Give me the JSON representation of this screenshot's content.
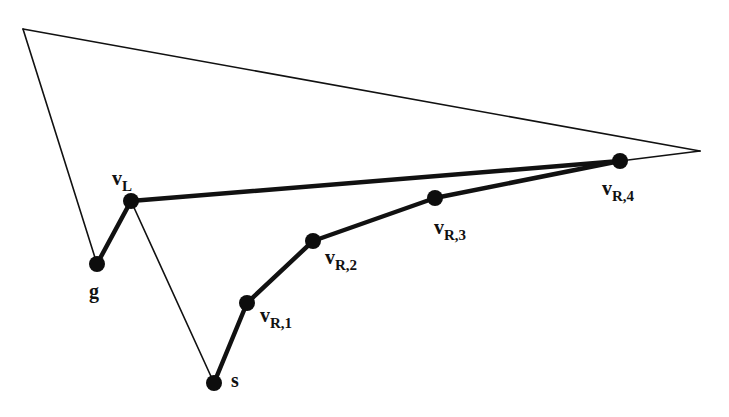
{
  "diagram": {
    "colors": {
      "stroke": "#111111",
      "vertex": "#0d0d0d",
      "background": "#ffffff"
    },
    "polygon_outline": [
      [
        23,
        29
      ],
      [
        700,
        151
      ],
      [
        620,
        161
      ]
    ],
    "outline_segments": [
      {
        "from": [
          23,
          29
        ],
        "to": [
          700,
          151
        ]
      },
      {
        "from": [
          700,
          151
        ],
        "to": [
          620,
          161
        ]
      },
      {
        "from": [
          23,
          29
        ],
        "to": [
          97,
          264
        ]
      },
      {
        "from": [
          131,
          201
        ],
        "to": [
          214,
          383
        ]
      }
    ],
    "vertices": [
      {
        "id": "g",
        "label": "g",
        "sub": "",
        "x": 97,
        "y": 264,
        "label_x": 89,
        "label_y": 281
      },
      {
        "id": "vL",
        "label": "v",
        "sub": "L",
        "x": 131,
        "y": 201,
        "label_x": 112,
        "label_y": 168
      },
      {
        "id": "s",
        "label": "s",
        "sub": "",
        "x": 214,
        "y": 383,
        "label_x": 231,
        "label_y": 370
      },
      {
        "id": "vR1",
        "label": "v",
        "sub": "R,1",
        "x": 247,
        "y": 303,
        "label_x": 260,
        "label_y": 305
      },
      {
        "id": "vR2",
        "label": "v",
        "sub": "R,2",
        "x": 313,
        "y": 241,
        "label_x": 325,
        "label_y": 247
      },
      {
        "id": "vR3",
        "label": "v",
        "sub": "R,3",
        "x": 435,
        "y": 198,
        "label_x": 434,
        "label_y": 217
      },
      {
        "id": "vR4",
        "label": "v",
        "sub": "R,4",
        "x": 620,
        "y": 161,
        "label_x": 602,
        "label_y": 178
      }
    ],
    "left_chain": [
      "g",
      "vL",
      "vR4"
    ],
    "right_chain": [
      "s",
      "vR1",
      "vR2",
      "vR3",
      "vR4"
    ]
  }
}
